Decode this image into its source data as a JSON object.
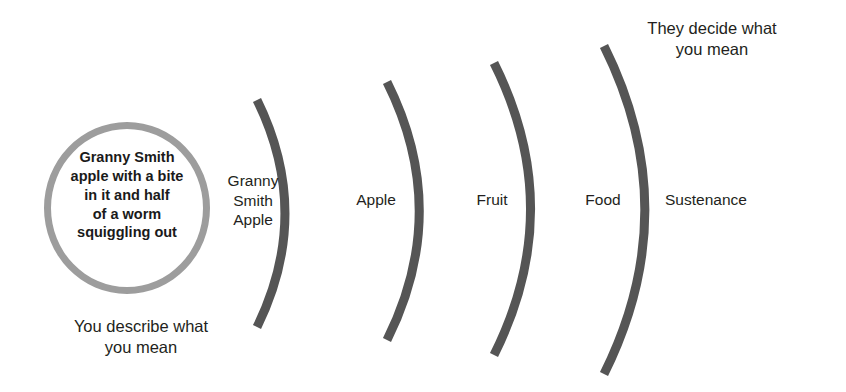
{
  "diagram": {
    "colors": {
      "circle_stroke": "#9d9d9d",
      "arc_stroke": "#555555",
      "text": "#231f20",
      "background": "#ffffff"
    },
    "circle": {
      "text": "Granny Smith\napple with a bite\nin it and half\nof a worm\nsquiggling out",
      "lines": [
        "Granny Smith",
        "apple with a bite",
        "in it and half",
        "of a worm",
        "squiggling out"
      ]
    },
    "captions": {
      "left": "You describe what\nyou mean",
      "right": "They decide what\nyou mean"
    },
    "arcs": [
      {
        "label": "Granny\nSmith\nApple",
        "apex_x": 283,
        "top_y": 100,
        "bottom_y": 327,
        "bulge": 26
      },
      {
        "label": "Apple",
        "apex_x": 417,
        "top_y": 82,
        "bottom_y": 340,
        "bulge": 30
      },
      {
        "label": "Fruit",
        "apex_x": 528,
        "top_y": 63,
        "bottom_y": 355,
        "bulge": 34
      },
      {
        "label": "Food",
        "apex_x": 642,
        "top_y": 46,
        "bottom_y": 374,
        "bulge": 38
      },
      {
        "label": "Sustenance",
        "apex_x": 642,
        "top_y": 46,
        "bottom_y": 374,
        "bulge": 38
      }
    ],
    "arc_count": 4,
    "arc_labels": [
      "Granny\nSmith\nApple",
      "Apple",
      "Fruit",
      "Food",
      "Sustenance"
    ]
  }
}
